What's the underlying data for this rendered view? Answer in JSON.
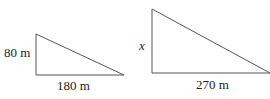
{
  "diagram": {
    "small_triangle": {
      "height_label": "80 m",
      "base_label": "180 m"
    },
    "large_triangle": {
      "height_label": "x",
      "base_label": "270 m"
    },
    "colors": {
      "line": "#555555",
      "text": "#222222"
    }
  }
}
